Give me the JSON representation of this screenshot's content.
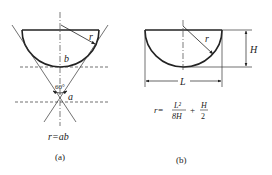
{
  "figure_a": {
    "label_r": "r",
    "label_b": "b",
    "label_a": "a",
    "angle": "60°",
    "formula": "r=ab",
    "caption": "(a)"
  },
  "figure_b": {
    "label_r": "r",
    "label_H": "H",
    "label_L": "L",
    "formula_lhs": "r=",
    "frac1_num": "L²",
    "frac1_den": "8H",
    "plus": "+",
    "frac2_num": "H",
    "frac2_den": "2",
    "caption": "(b)"
  },
  "colors": {
    "stroke": "#222222",
    "background": "#ffffff"
  }
}
